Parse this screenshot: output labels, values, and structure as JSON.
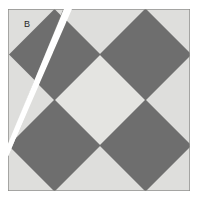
{
  "figure": {
    "label_b": "B",
    "colors": {
      "background": "#ffffff",
      "light_tile": "#dededc",
      "center_tile": "#e4e4e1",
      "dark_tile": "#6e6e6e",
      "outline": "#8d8d8a",
      "dark_outline": "#5a5a5a",
      "cut_gap": "#ffffff",
      "label_text": "#262626"
    },
    "square": {
      "x": 8,
      "y": 9,
      "width": 182,
      "height": 182
    },
    "grid": {
      "rows": 2,
      "cols": 2,
      "diamond_count": 4,
      "center_diamond_count": 1
    },
    "dark_diamonds": [
      {
        "name": "diamond-top-left",
        "cx": 54.5,
        "cy": 54.5,
        "r": 45.5
      },
      {
        "name": "diamond-top-right",
        "cx": 145.5,
        "cy": 54.5,
        "r": 45.5
      },
      {
        "name": "diamond-bottom-left",
        "cx": 54.5,
        "cy": 145.5,
        "r": 45.5
      },
      {
        "name": "diamond-bottom-right",
        "cx": 145.5,
        "cy": 145.5,
        "r": 45.5
      }
    ],
    "center_diamond": {
      "name": "diamond-center",
      "cx": 100,
      "cy": 100,
      "r": 45.5
    },
    "cut_line": {
      "name": "diagonal-cut",
      "from_x": 68,
      "from_y": 9,
      "to_x": 8,
      "to_y": 152,
      "gap_width": 4.5,
      "description": "white diagonal cut separating piece B region"
    },
    "label_position": {
      "x": 24,
      "y": 24
    }
  }
}
